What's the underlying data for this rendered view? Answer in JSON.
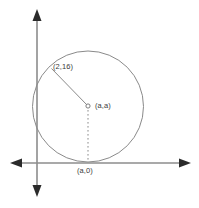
{
  "figure": {
    "type": "geometry-diagram",
    "axes": {
      "x_axis_name": "x-axis",
      "y_axis_name": "y-axis",
      "origin_px": [
        37,
        163
      ],
      "x_axis_span_px": [
        11,
        190
      ],
      "y_axis_span_px": [
        10,
        196
      ],
      "arrowheads": [
        "left",
        "right",
        "up",
        "down"
      ],
      "color": "#8c8c8c"
    },
    "circle": {
      "center_px": [
        88,
        106
      ],
      "radius_px": 55,
      "color": "#7d7d7d",
      "tangent_to": "x-axis"
    },
    "center_marker": {
      "name": "center-point",
      "px": [
        88,
        106
      ]
    },
    "radius_segment": {
      "from_px": [
        88,
        106
      ],
      "to_px": [
        51,
        68
      ],
      "style": "solid"
    },
    "height_segment": {
      "from_px": [
        88,
        106
      ],
      "to_px": [
        88,
        163
      ],
      "style": "dashed"
    },
    "labels": {
      "point_on_circle": "(2,16)",
      "center": "(a,a)",
      "tangent_point": "(a,0)"
    }
  }
}
